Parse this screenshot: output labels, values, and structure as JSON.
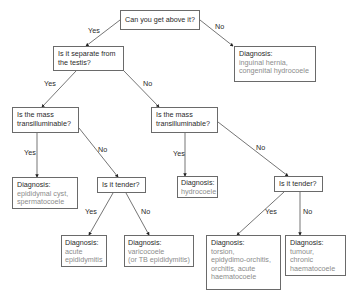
{
  "nodes": {
    "q_above": {
      "text": "Can you get above it?"
    },
    "q_separate": {
      "lines": [
        "Is it separate from",
        "the testis?"
      ]
    },
    "dx_inguinal": {
      "label": "Diagnosis:",
      "lines": [
        "inguinal hernia,",
        "congenital hydrocoele"
      ]
    },
    "q_trans_left": {
      "lines": [
        "Is the mass",
        "transilluminable?"
      ]
    },
    "q_trans_right": {
      "lines": [
        "Is the mass",
        "transilluminable?"
      ]
    },
    "dx_epididymal": {
      "label": "Diagnosis:",
      "lines": [
        "epididymal cyst,",
        "spermatocoele"
      ]
    },
    "q_tender_left": {
      "text": "Is it tender?"
    },
    "dx_hydrocoele": {
      "label": "Diagnosis:",
      "lines": [
        "hydrocoele"
      ]
    },
    "q_tender_right": {
      "text": "Is it tender?"
    },
    "dx_acute": {
      "label": "Diagnosis:",
      "lines": [
        "acute",
        "epididymitis"
      ]
    },
    "dx_varicocoele": {
      "label": "Diagnosis:",
      "lines": [
        "varicocoele",
        "(or TB epididymitis)"
      ]
    },
    "dx_torsion": {
      "label": "Diagnosis:",
      "lines": [
        "torsion,",
        "epidydimo-orchitis,",
        "orchitis, acute",
        "haematocoele"
      ]
    },
    "dx_tumour": {
      "label": "Diagnosis:",
      "lines": [
        "tumour,",
        "chronic",
        "haematocoele"
      ]
    }
  },
  "edge_labels": {
    "above_yes": "Yes",
    "above_no": "No",
    "separate_yes": "Yes",
    "separate_no": "No",
    "transL_yes": "Yes",
    "transL_no": "No",
    "transR_yes": "Yes",
    "transR_no": "No",
    "tenderL_yes": "Yes",
    "tenderL_no": "No",
    "tenderR_yes": "Yes",
    "tenderR_no": "No"
  },
  "colors": {
    "line": "#3a3a3a",
    "border": "#6a6a6a",
    "question_text": "#2a2a2a",
    "diagnosis_text": "#8c8c8c"
  }
}
